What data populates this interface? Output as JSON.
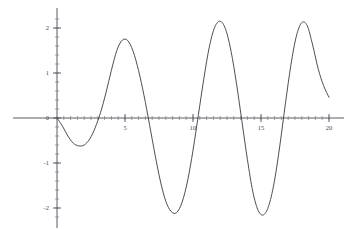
{
  "chart_data": {
    "type": "line",
    "title": "",
    "subtitle": "",
    "xlabel": "",
    "ylabel": "",
    "xlim": [
      0,
      20
    ],
    "ylim": [
      -2.35,
      2.35
    ],
    "grid": false,
    "legend": null,
    "x_ticks": [
      {
        "value": 5,
        "label": "5"
      },
      {
        "value": 10,
        "label": "10"
      },
      {
        "value": 15,
        "label": "15"
      },
      {
        "value": 20,
        "label": "20"
      }
    ],
    "y_ticks": [
      {
        "value": 2,
        "label": "2"
      },
      {
        "value": 1,
        "label": "1"
      },
      {
        "value": 0,
        "label": "0"
      },
      {
        "value": -1,
        "label": "-1"
      },
      {
        "value": -2,
        "label": "-2"
      }
    ],
    "x_minor_tick_step": 0.5,
    "y_minor_tick_step": 0.2,
    "series": [
      {
        "name": "curve",
        "color": "#3a3a42",
        "x": [
          0.0,
          0.4,
          0.8,
          1.2,
          1.6,
          2.0,
          2.4,
          2.8,
          3.2,
          3.6,
          4.0,
          4.4,
          4.8,
          5.2,
          5.6,
          6.0,
          6.4,
          6.8,
          7.2,
          7.6,
          8.0,
          8.4,
          8.8,
          9.2,
          9.6,
          10.0,
          10.4,
          10.8,
          11.2,
          11.6,
          12.0,
          12.4,
          12.8,
          13.2,
          13.6,
          14.0,
          14.4,
          14.8,
          15.2,
          15.6,
          16.0,
          16.4,
          16.8,
          17.2,
          17.6,
          18.0,
          18.4,
          18.8,
          19.2,
          19.6,
          20.0
        ],
        "y": [
          0.0,
          -0.18,
          -0.4,
          -0.56,
          -0.62,
          -0.6,
          -0.47,
          -0.22,
          0.12,
          0.56,
          1.06,
          1.5,
          1.73,
          1.72,
          1.48,
          1.05,
          0.5,
          -0.14,
          -0.8,
          -1.4,
          -1.85,
          -2.08,
          -2.1,
          -1.87,
          -1.4,
          -0.72,
          0.08,
          0.88,
          1.58,
          2.02,
          2.15,
          1.97,
          1.48,
          0.76,
          -0.08,
          -0.92,
          -1.64,
          -2.06,
          -2.15,
          -1.92,
          -1.38,
          -0.58,
          0.33,
          1.18,
          1.82,
          2.12,
          2.05,
          1.62,
          1.1,
          0.72,
          0.46
        ],
        "annotations": {
          "first_minimum": {
            "x": 1.8,
            "y": -0.62
          },
          "first_maximum": {
            "x": 4.6,
            "y": 1.75
          },
          "second_minimum": {
            "x": 8.6,
            "y": -2.1
          },
          "second_maximum": {
            "x": 12.1,
            "y": 2.15
          },
          "third_minimum": {
            "x": 15.2,
            "y": -2.16
          },
          "third_maximum": {
            "x": 18.1,
            "y": 2.13
          },
          "end_value": {
            "x": 20.0,
            "y": 0.46
          }
        }
      }
    ]
  },
  "plot": {
    "axis_color": "#5a5a66",
    "curve_color": "#3a3a42",
    "background_color": "#ffffff",
    "origin_px": {
      "x": 57,
      "y": 118
    },
    "scale_px": {
      "x_per_unit": 13.6,
      "y_per_unit": 45
    }
  }
}
